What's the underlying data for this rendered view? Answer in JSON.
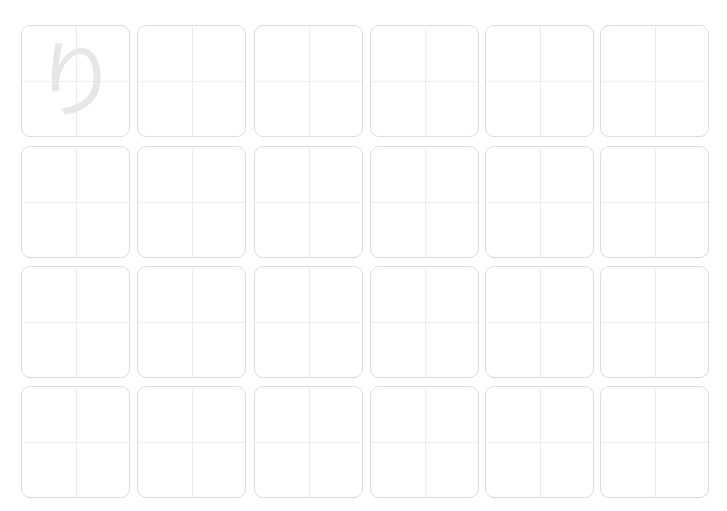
{
  "worksheet": {
    "guide_character": "り",
    "guide_color": "#e6e6e6",
    "border_color": "#dcdcdc",
    "guide_line_color": "#ececec",
    "rows": 4,
    "columns": 6,
    "cells": [
      {
        "row": 0,
        "col": 0,
        "x": 21,
        "y": 25,
        "guide": "り"
      },
      {
        "row": 0,
        "col": 1,
        "x": 137,
        "y": 25
      },
      {
        "row": 0,
        "col": 2,
        "x": 254,
        "y": 25
      },
      {
        "row": 0,
        "col": 3,
        "x": 370,
        "y": 25
      },
      {
        "row": 0,
        "col": 4,
        "x": 485,
        "y": 25
      },
      {
        "row": 0,
        "col": 5,
        "x": 600,
        "y": 25
      },
      {
        "row": 1,
        "col": 0,
        "x": 21,
        "y": 146
      },
      {
        "row": 1,
        "col": 1,
        "x": 137,
        "y": 146
      },
      {
        "row": 1,
        "col": 2,
        "x": 254,
        "y": 146
      },
      {
        "row": 1,
        "col": 3,
        "x": 370,
        "y": 146
      },
      {
        "row": 1,
        "col": 4,
        "x": 485,
        "y": 146
      },
      {
        "row": 1,
        "col": 5,
        "x": 600,
        "y": 146
      },
      {
        "row": 2,
        "col": 0,
        "x": 21,
        "y": 266
      },
      {
        "row": 2,
        "col": 1,
        "x": 137,
        "y": 266
      },
      {
        "row": 2,
        "col": 2,
        "x": 254,
        "y": 266
      },
      {
        "row": 2,
        "col": 3,
        "x": 370,
        "y": 266
      },
      {
        "row": 2,
        "col": 4,
        "x": 485,
        "y": 266
      },
      {
        "row": 2,
        "col": 5,
        "x": 600,
        "y": 266
      },
      {
        "row": 3,
        "col": 0,
        "x": 21,
        "y": 386
      },
      {
        "row": 3,
        "col": 1,
        "x": 137,
        "y": 386
      },
      {
        "row": 3,
        "col": 2,
        "x": 254,
        "y": 386
      },
      {
        "row": 3,
        "col": 3,
        "x": 370,
        "y": 386
      },
      {
        "row": 3,
        "col": 4,
        "x": 485,
        "y": 386
      },
      {
        "row": 3,
        "col": 5,
        "x": 600,
        "y": 386
      }
    ]
  }
}
